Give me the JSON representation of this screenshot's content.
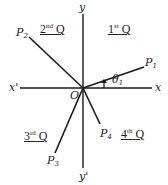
{
  "diagram": {
    "axes": {
      "x_pos_label": "x",
      "x_neg_label": "x'",
      "y_pos_label": "y",
      "y_neg_label": "y'",
      "origin_label": "O"
    },
    "quadrants": [
      {
        "num": "1",
        "suffix": "st",
        "letter": "Q"
      },
      {
        "num": "2",
        "suffix": "nd",
        "letter": "Q"
      },
      {
        "num": "3",
        "suffix": "rd",
        "letter": "Q"
      },
      {
        "num": "4",
        "suffix": "th",
        "letter": "Q"
      }
    ],
    "points": [
      {
        "base": "P",
        "sub": "1"
      },
      {
        "base": "P",
        "sub": "2"
      },
      {
        "base": "P",
        "sub": "3"
      },
      {
        "base": "P",
        "sub": "4"
      }
    ],
    "angle": {
      "base": "θ",
      "sub": "1"
    },
    "line_color": "#1a1a1a"
  }
}
